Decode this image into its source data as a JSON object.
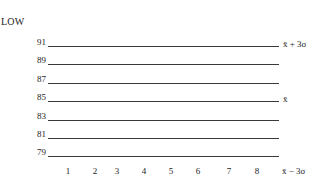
{
  "chart": {
    "title": "LOW",
    "y_levels": [
      {
        "value": "91",
        "y": 46,
        "right_label": "x̄ + 3σ"
      },
      {
        "value": "89",
        "y": 64,
        "right_label": ""
      },
      {
        "value": "87",
        "y": 83,
        "right_label": ""
      },
      {
        "value": "85",
        "y": 101,
        "right_label": "x̄"
      },
      {
        "value": "83",
        "y": 120,
        "right_label": ""
      },
      {
        "value": "81",
        "y": 138,
        "right_label": ""
      },
      {
        "value": "79",
        "y": 156,
        "right_label": ""
      }
    ],
    "x_ticks": [
      {
        "label": "1",
        "x": 68
      },
      {
        "label": "2",
        "x": 95
      },
      {
        "label": "3",
        "x": 117
      },
      {
        "label": "4",
        "x": 144
      },
      {
        "label": "5",
        "x": 171
      },
      {
        "label": "6",
        "x": 198
      },
      {
        "label": "7",
        "x": 229
      },
      {
        "label": "8",
        "x": 257
      }
    ],
    "x_right_label": "x̄ − 3σ"
  }
}
